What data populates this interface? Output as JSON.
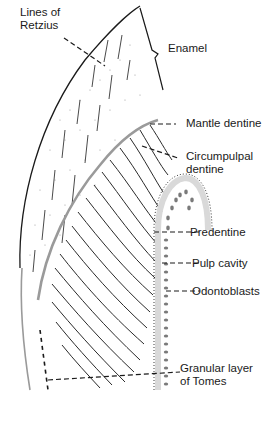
{
  "figure": {
    "labels": {
      "lines_of_retzius": [
        "Lines of",
        "Retzius"
      ],
      "enamel": "Enamel",
      "mantle_dentine": "Mantle dentine",
      "circumpulpal_dentine": [
        "Circumpulpal",
        "dentine"
      ],
      "predentine": "Predentine",
      "pulp_cavity": "Pulp cavity",
      "odontoblasts": "Odontoblasts",
      "granular_layer": [
        "Granular layer",
        "of Tomes"
      ]
    },
    "colors": {
      "outline": "#1a1a1a",
      "dej_line": "#9a9a9a",
      "predentine_band": "#d9d9d9",
      "odontoblast": "#7a7a7a",
      "stipple": "#8a8a8a"
    }
  }
}
